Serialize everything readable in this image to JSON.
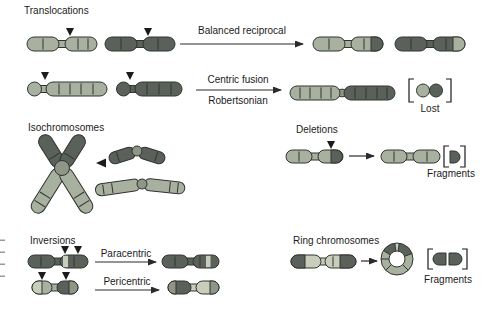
{
  "palette": {
    "light": "#a8b0a0",
    "pale": "#c9cdbb",
    "mid": "#8f9687",
    "dark": "#5a605a",
    "outline": "#2f342f",
    "arrow": "#2b2b2b",
    "text": "#1b1b1b",
    "background": "#ffffff"
  },
  "sections": {
    "translocations": {
      "title": "Translocations",
      "balanced_label": "Balanced reciprocal",
      "centric_label_top": "Centric fusion",
      "centric_label_bottom": "Robertsonian",
      "lost_label": "Lost"
    },
    "isochromosomes": {
      "title": "Isochromosomes"
    },
    "deletions": {
      "title": "Deletions",
      "fragments_label": "Fragments"
    },
    "inversions": {
      "title": "Inversions",
      "paracentric_label": "Paracentric",
      "pericentric_label": "Pericentric"
    },
    "ring_chromosomes": {
      "title": "Ring chromosomes",
      "fragments_label": "Fragments"
    }
  }
}
